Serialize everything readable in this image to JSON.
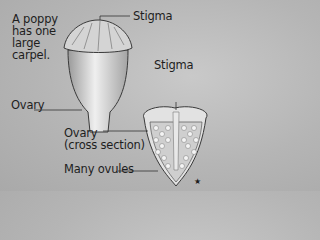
{
  "labels": {
    "intro": [
      "A poppy",
      "has one",
      "large",
      "carpel."
    ],
    "stigma_top": "Stigma",
    "stigma_right": "Stigma",
    "ovary": "Ovary",
    "ovary_cross": [
      "Ovary",
      "(cross section)"
    ],
    "ovules": "Many ovules",
    "star": "★"
  }
}
